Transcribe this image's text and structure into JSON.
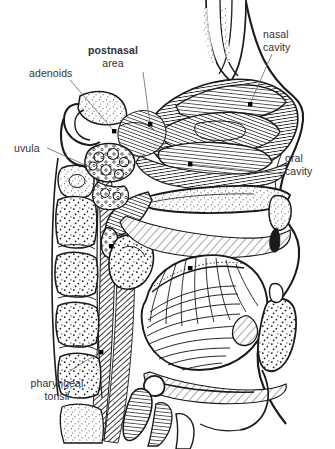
{
  "figure": {
    "background_color": "#ffffff",
    "ink_color": "#1a1a1a",
    "label_color": "#333132",
    "leader_color": "#6e6e6e",
    "marker_color": "#000000",
    "width": 335,
    "height": 449
  },
  "labels": [
    {
      "id": "postnasal-area",
      "line1": "postnasal",
      "line2": "area",
      "line1_weight": "bold",
      "line2_weight": "regular",
      "align": "center",
      "x": 113,
      "y": 44
    },
    {
      "id": "nasal-cavity",
      "line1": "nasal",
      "line2": "cavity",
      "line1_weight": "regular",
      "line2_weight": "regular",
      "align": "left",
      "x": 263,
      "y": 28
    },
    {
      "id": "adenoids",
      "line1": "adenoids",
      "line2": "",
      "line1_weight": "regular",
      "line2_weight": "regular",
      "align": "left",
      "x": 29,
      "y": 67
    },
    {
      "id": "uvula",
      "line1": "uvula",
      "line2": "",
      "line1_weight": "regular",
      "line2_weight": "regular",
      "align": "left",
      "x": 14,
      "y": 142
    },
    {
      "id": "oral-cavity",
      "line1": "oral",
      "line2": "cavity",
      "line1_weight": "regular",
      "line2_weight": "regular",
      "align": "left",
      "x": 285,
      "y": 152
    },
    {
      "id": "pharyngeal-tonsil",
      "line1": "pharyngeal",
      "line2": "tonsil",
      "line1_weight": "regular",
      "line2_weight": "regular",
      "align": "center",
      "x": 24,
      "y": 377
    }
  ],
  "structures": [
    "nasal cavity",
    "nasal septum",
    "postnasal area",
    "adenoids",
    "uvula",
    "soft palate",
    "hard palate",
    "oral cavity",
    "tongue",
    "pharyngeal tonsil",
    "cervical vertebrae",
    "pharyngeal wall",
    "mandible",
    "hyoid bone",
    "epiglottis"
  ]
}
